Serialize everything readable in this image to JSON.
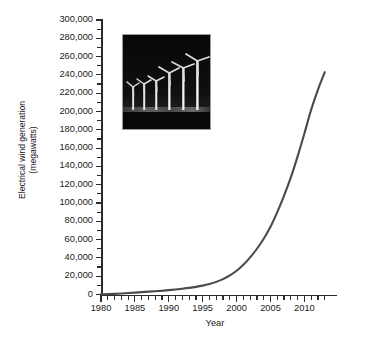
{
  "chart_data": {
    "type": "line",
    "title": "",
    "xlabel": "Year",
    "ylabel": "Electrical wind generation (megawatts)",
    "ylabel_line1": "Electrical wind generation",
    "ylabel_line2": "(megawatts)",
    "xlim": [
      1980,
      2013.5
    ],
    "ylim": [
      0,
      300000
    ],
    "ytick_step": 20000,
    "yminor_step": 10000,
    "xtick_step": 5,
    "xminor_step": 1,
    "grid": false,
    "legend": "none",
    "line_color": "#4a4a4a",
    "axis_color": "#2b2b2b",
    "ytick_labels": [
      "0",
      "20,000",
      "40,000",
      "60,000",
      "80,000",
      "100,000",
      "120,000",
      "140,000",
      "160,000",
      "180,000",
      "200,000",
      "220,000",
      "240,000",
      "260,000",
      "280,000",
      "300,000"
    ],
    "ytick_values": [
      0,
      20000,
      40000,
      60000,
      80000,
      100000,
      120000,
      140000,
      160000,
      180000,
      200000,
      220000,
      240000,
      260000,
      280000,
      300000
    ],
    "xtick_labels": [
      "1980",
      "1985",
      "1990",
      "1995",
      "2000",
      "2005",
      "2010"
    ],
    "xtick_values": [
      1980,
      1985,
      1990,
      1995,
      2000,
      2005,
      2010
    ],
    "series": [
      {
        "name": "Electrical wind generation",
        "x": [
          1980,
          1981,
          1982,
          1983,
          1984,
          1985,
          1986,
          1987,
          1988,
          1989,
          1990,
          1991,
          1992,
          1993,
          1994,
          1995,
          1996,
          1997,
          1998,
          1999,
          2000,
          2001,
          2002,
          2003,
          2004,
          2005,
          2006,
          2007,
          2008,
          2009,
          2010,
          2011,
          2012,
          2013
        ],
        "values": [
          10,
          25,
          90,
          210,
          600,
          1020,
          1270,
          1450,
          1580,
          1730,
          1930,
          2170,
          2510,
          2990,
          3490,
          4780,
          6100,
          7600,
          10200,
          13600,
          17400,
          23900,
          31100,
          39431,
          47620,
          59091,
          74052,
          93820,
          120690,
          159050,
          197940,
          238110,
          282580,
          243000
        ],
        "display_x": [
          1980,
          1981,
          1982,
          1983,
          1984,
          1985,
          1986,
          1987,
          1988,
          1989,
          1990,
          1991,
          1992,
          1993,
          1994,
          1995,
          1996,
          1997,
          1998,
          1999,
          2000,
          2001,
          2002,
          2003,
          2004,
          2005,
          2006,
          2007,
          2008,
          2009,
          2010,
          2011,
          2012,
          2013
        ],
        "display_values": [
          200,
          400,
          700,
          1100,
          1600,
          2100,
          2600,
          3100,
          3600,
          4100,
          4800,
          5500,
          6300,
          7200,
          8300,
          9700,
          11500,
          13800,
          16800,
          20800,
          26000,
          32500,
          40500,
          50000,
          61000,
          74000,
          90000,
          108000,
          128000,
          151000,
          176000,
          202000,
          224000,
          243000
        ],
        "end_point": {
          "year": 2013,
          "value": 243000
        }
      }
    ]
  },
  "inset_photo": {
    "name": "wind-turbine-photograph",
    "description": "Night photograph of a row of white wind turbines against a dark sky",
    "turbine_count": 6,
    "background_color": "#0a0a0a",
    "turbine_color": "#e8e8e8",
    "border_color": "#9a9a9a"
  }
}
